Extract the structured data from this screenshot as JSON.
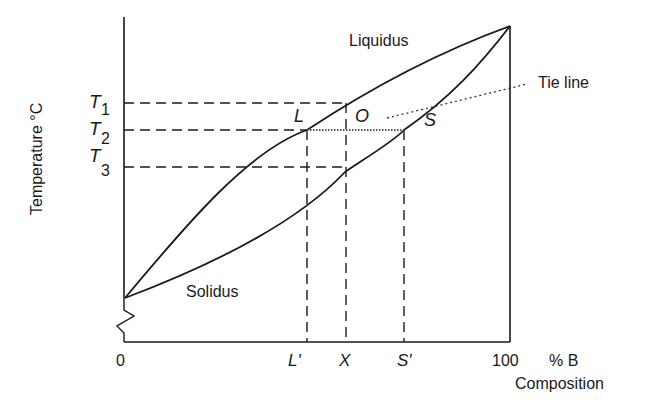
{
  "diagram": {
    "type": "binary isomorphous phase diagram",
    "y_axis_label": "Temperature °C",
    "x_axis_label": "Composition",
    "x_unit": "% B",
    "x_ticks": {
      "left": "0",
      "right": "100"
    },
    "curves": {
      "liquidus": "Liquidus",
      "solidus": "Solidus"
    },
    "temperatures": [
      {
        "sym": "T",
        "sub": "1"
      },
      {
        "sym": "T",
        "sub": "2"
      },
      {
        "sym": "T",
        "sub": "3"
      }
    ],
    "points": {
      "L": "L",
      "O": "O",
      "S": "S"
    },
    "compositions": {
      "L_prime": "L'",
      "X": "X",
      "S_prime": "S'"
    },
    "annotation": "Tie line",
    "colors": {
      "line": "#1a1a1a",
      "background": "#ffffff"
    }
  }
}
